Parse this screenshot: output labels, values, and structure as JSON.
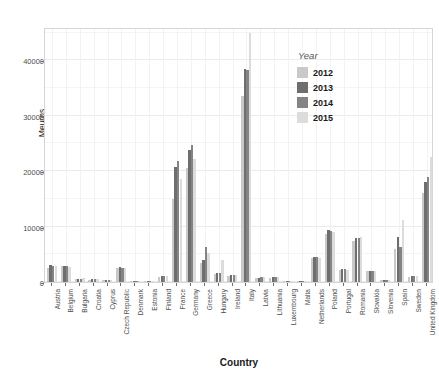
{
  "chart_data": {
    "type": "bar",
    "title": "",
    "xlabel": "Country",
    "ylabel": "Meuros",
    "ylim": [
      0,
      46000
    ],
    "yticks": [
      0,
      10000,
      20000,
      30000,
      40000
    ],
    "ytick_labels": [
      "0",
      "10000",
      "20000",
      "30000",
      "40000"
    ],
    "grid": true,
    "legend_position": "top-right-inside",
    "legend_title": "Year",
    "categories": [
      "Austria",
      "Belgium",
      "Bulgaria",
      "Croatia",
      "Cyprus",
      "Czech Republic",
      "Denmark",
      "Estonia",
      "Finland",
      "France",
      "Germany",
      "Greece",
      "Hungary",
      "Ireland",
      "Italy",
      "Latvia",
      "Lithuania",
      "Luxembourg",
      "Malta",
      "Netherlands",
      "Poland",
      "Portugal",
      "Romania",
      "Slovakia",
      "Slovenia",
      "Spain",
      "Sweden",
      "United Kingdom"
    ],
    "series": [
      {
        "name": "2012",
        "color": "#c9c9c9",
        "values": [
          2600,
          2800,
          500,
          400,
          300,
          2500,
          200,
          200,
          900,
          15000,
          20500,
          3400,
          1400,
          1100,
          33500,
          700,
          800,
          150,
          200,
          4400,
          8700,
          2100,
          7400,
          1900,
          400,
          5900,
          900,
          16000
        ]
      },
      {
        "name": "2013",
        "color": "#6e6e6e",
        "values": [
          3000,
          2900,
          600,
          500,
          400,
          2700,
          250,
          250,
          1000,
          20800,
          23900,
          4000,
          1600,
          1300,
          38500,
          800,
          850,
          180,
          250,
          4600,
          9300,
          2300,
          7900,
          2000,
          450,
          8100,
          1000,
          18000
        ]
      },
      {
        "name": "2014",
        "color": "#848484",
        "values": [
          2900,
          2800,
          600,
          550,
          400,
          2600,
          250,
          250,
          1000,
          21800,
          24800,
          6300,
          1700,
          1300,
          38300,
          850,
          900,
          180,
          250,
          4500,
          9200,
          2300,
          8000,
          2000,
          450,
          6400,
          1000,
          19000
        ]
      },
      {
        "name": "2015",
        "color": "#dcdcdc",
        "values": [
          2900,
          2700,
          650,
          550,
          400,
          2600,
          250,
          250,
          1000,
          18500,
          22200,
          5300,
          4000,
          1300,
          45000,
          850,
          900,
          180,
          250,
          4300,
          9000,
          2200,
          8100,
          1900,
          450,
          11200,
          1000,
          22500
        ]
      }
    ]
  },
  "axes": {
    "y_title": "Meuros",
    "x_title": "Country"
  },
  "legend": {
    "title": "Year",
    "items": [
      {
        "label": "2012",
        "color": "#c9c9c9"
      },
      {
        "label": "2013",
        "color": "#6e6e6e"
      },
      {
        "label": "2014",
        "color": "#848484"
      },
      {
        "label": "2015",
        "color": "#dcdcdc"
      }
    ]
  },
  "colors": {
    "panel_background": "#ffffff",
    "panel_border": "#d6d6d6",
    "gridline_major": "#ebebeb",
    "gridline_minor": "#f4f4f4",
    "text": "#4d4d4d"
  }
}
